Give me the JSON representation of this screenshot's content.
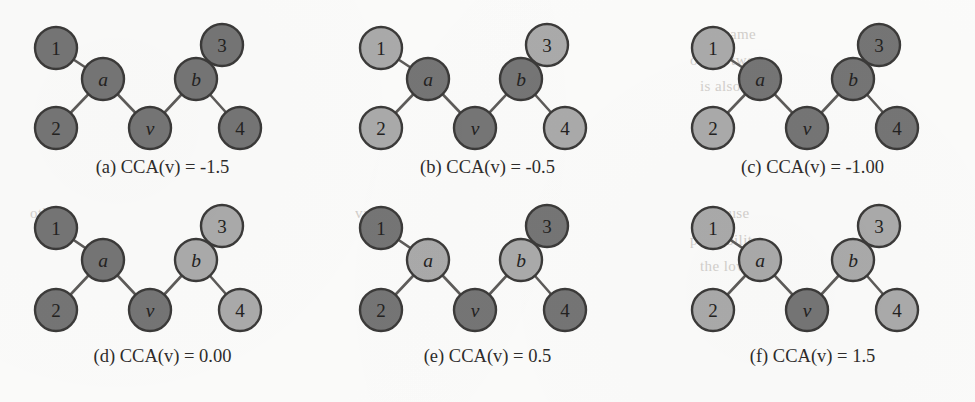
{
  "figure": {
    "title": "CCA(v) example graphs",
    "node_colors": {
      "dark": "#757575",
      "light": "#aaaaaa",
      "outline": "#3b3a39",
      "edge": "#5d5b59"
    },
    "edges": [
      "1-a",
      "2-a",
      "a-v",
      "v-b",
      "b-3",
      "b-4"
    ],
    "panels": [
      {
        "key": "a",
        "caption": "(a) CCA(v) = -1.5",
        "label": "(a)",
        "metric": "CCA(v)",
        "value": "-1.5",
        "nodes": [
          {
            "id": "1",
            "shade": "dark"
          },
          {
            "id": "2",
            "shade": "dark"
          },
          {
            "id": "a",
            "shade": "dark"
          },
          {
            "id": "v",
            "shade": "dark"
          },
          {
            "id": "b",
            "shade": "dark"
          },
          {
            "id": "3",
            "shade": "dark"
          },
          {
            "id": "4",
            "shade": "dark"
          }
        ]
      },
      {
        "key": "b",
        "caption": "(b) CCA(v) = -0.5",
        "label": "(b)",
        "metric": "CCA(v)",
        "value": "-0.5",
        "nodes": [
          {
            "id": "1",
            "shade": "light"
          },
          {
            "id": "2",
            "shade": "light"
          },
          {
            "id": "a",
            "shade": "dark"
          },
          {
            "id": "v",
            "shade": "dark"
          },
          {
            "id": "b",
            "shade": "dark"
          },
          {
            "id": "3",
            "shade": "light"
          },
          {
            "id": "4",
            "shade": "light"
          }
        ]
      },
      {
        "key": "c",
        "caption": "(c) CCA(v) = -1.00",
        "label": "(c)",
        "metric": "CCA(v)",
        "value": "-1.00",
        "nodes": [
          {
            "id": "1",
            "shade": "light"
          },
          {
            "id": "2",
            "shade": "light"
          },
          {
            "id": "a",
            "shade": "dark"
          },
          {
            "id": "v",
            "shade": "dark"
          },
          {
            "id": "b",
            "shade": "dark"
          },
          {
            "id": "3",
            "shade": "dark"
          },
          {
            "id": "4",
            "shade": "dark"
          }
        ]
      },
      {
        "key": "d",
        "caption": "(d) CCA(v) = 0.00",
        "label": "(d)",
        "metric": "CCA(v)",
        "value": "0.00",
        "nodes": [
          {
            "id": "1",
            "shade": "dark"
          },
          {
            "id": "2",
            "shade": "dark"
          },
          {
            "id": "a",
            "shade": "dark"
          },
          {
            "id": "v",
            "shade": "dark"
          },
          {
            "id": "b",
            "shade": "light"
          },
          {
            "id": "3",
            "shade": "light"
          },
          {
            "id": "4",
            "shade": "light"
          }
        ]
      },
      {
        "key": "e",
        "caption": "(e) CCA(v) = 0.5",
        "label": "(e)",
        "metric": "CCA(v)",
        "value": "0.5",
        "nodes": [
          {
            "id": "1",
            "shade": "dark"
          },
          {
            "id": "2",
            "shade": "dark"
          },
          {
            "id": "a",
            "shade": "light"
          },
          {
            "id": "v",
            "shade": "dark"
          },
          {
            "id": "b",
            "shade": "light"
          },
          {
            "id": "3",
            "shade": "dark"
          },
          {
            "id": "4",
            "shade": "dark"
          }
        ]
      },
      {
        "key": "f",
        "caption": "(f) CCA(v) = 1.5",
        "label": "(f)",
        "metric": "CCA(v)",
        "value": "1.5",
        "nodes": [
          {
            "id": "1",
            "shade": "light"
          },
          {
            "id": "2",
            "shade": "light"
          },
          {
            "id": "a",
            "shade": "light"
          },
          {
            "id": "v",
            "shade": "dark"
          },
          {
            "id": "b",
            "shade": "light"
          },
          {
            "id": "3",
            "shade": "light"
          },
          {
            "id": "4",
            "shade": "light"
          }
        ]
      }
    ]
  },
  "bleed_text": {
    "lines": [
      "the same",
      "of the two",
      "is also",
      "we use",
      "probability",
      "the lower",
      "value",
      "other",
      "in the"
    ]
  }
}
